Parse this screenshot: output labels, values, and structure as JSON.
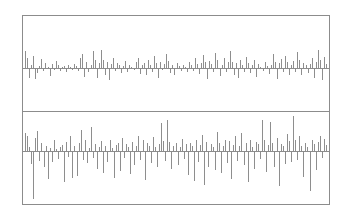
{
  "figure": {
    "title": "",
    "background_color": "#ffffff",
    "frame_color": "#8c8c8c",
    "stem_color": "#8e8e8e"
  },
  "chart_data": [
    {
      "type": "bar",
      "name": "top-panel-residuals",
      "title": "",
      "xlabel": "",
      "ylabel": "",
      "grid": false,
      "legend": null,
      "axis_labels_visible": false,
      "tick_labels_visible": false,
      "baseline": 0,
      "ylim": [
        -1,
        1
      ],
      "xlim": [
        0,
        150
      ],
      "x": [
        0,
        1,
        2,
        3,
        4,
        5,
        6,
        7,
        8,
        9,
        10,
        11,
        12,
        13,
        14,
        15,
        16,
        17,
        18,
        19,
        20,
        21,
        22,
        23,
        24,
        25,
        26,
        27,
        28,
        29,
        30,
        31,
        32,
        33,
        34,
        35,
        36,
        37,
        38,
        39,
        40,
        41,
        42,
        43,
        44,
        45,
        46,
        47,
        48,
        49,
        50,
        51,
        52,
        53,
        54,
        55,
        56,
        57,
        58,
        59,
        60,
        61,
        62,
        63,
        64,
        65,
        66,
        67,
        68,
        69,
        70,
        71,
        72,
        73,
        74,
        75,
        76,
        77,
        78,
        79,
        80,
        81,
        82,
        83,
        84,
        85,
        86,
        87,
        88,
        89,
        90,
        91,
        92,
        93,
        94,
        95,
        96,
        97,
        98,
        99,
        100,
        101,
        102,
        103,
        104,
        105,
        106,
        107,
        108,
        109,
        110,
        111,
        112,
        113,
        114,
        115,
        116,
        117,
        118,
        119,
        120,
        121,
        122,
        123,
        124,
        125,
        126,
        127,
        128,
        129,
        130,
        131,
        132,
        133,
        134,
        135,
        136,
        137,
        138,
        139,
        140,
        141,
        142,
        143,
        144,
        145,
        146,
        147,
        148,
        149
      ],
      "values": [
        0.52,
        0.3,
        -0.4,
        0.1,
        0.36,
        -0.46,
        -0.2,
        0.06,
        0.28,
        -0.08,
        0.16,
        0.04,
        -0.34,
        0.12,
        -0.06,
        0.22,
        0.08,
        -0.1,
        0.04,
        0.06,
        -0.14,
        0.1,
        0.02,
        -0.04,
        0.12,
        0.05,
        -0.08,
        0.3,
        0.44,
        -0.36,
        0.18,
        -0.12,
        0.1,
        0.54,
        0.24,
        -0.44,
        0.14,
        0.56,
        0.26,
        -0.3,
        0.2,
        -0.5,
        0.12,
        0.3,
        -0.1,
        0.16,
        0.08,
        -0.18,
        0.06,
        0.22,
        -0.14,
        0.1,
        0.04,
        -0.06,
        0.18,
        0.32,
        -0.22,
        0.08,
        0.14,
        -0.3,
        0.24,
        0.1,
        -0.12,
        0.36,
        0.16,
        -0.44,
        0.2,
        -0.06,
        0.12,
        0.42,
        0.22,
        -0.18,
        0.1,
        -0.26,
        0.14,
        0.06,
        -0.1,
        0.08,
        0.04,
        -0.14,
        0.2,
        0.1,
        -0.08,
        0.3,
        0.12,
        -0.24,
        0.16,
        0.4,
        0.18,
        -0.46,
        0.22,
        0.12,
        -0.16,
        0.48,
        0.26,
        -0.34,
        0.1,
        0.32,
        -0.14,
        0.18,
        0.52,
        0.2,
        -0.28,
        0.14,
        -0.4,
        0.24,
        0.1,
        -0.12,
        0.34,
        0.16,
        -0.2,
        0.08,
        0.26,
        -0.36,
        0.12,
        0.04,
        -0.1,
        0.18,
        0.06,
        -0.22,
        0.1,
        0.44,
        0.2,
        -0.48,
        0.14,
        0.28,
        -0.16,
        0.36,
        0.18,
        -0.26,
        0.1,
        0.22,
        -0.12,
        0.5,
        0.24,
        -0.3,
        0.16,
        0.08,
        -0.18,
        0.12,
        0.3,
        -0.42,
        0.2,
        0.56,
        0.26,
        -0.52,
        0.34,
        0.12
      ]
    },
    {
      "type": "bar",
      "name": "bottom-panel-residuals",
      "title": "",
      "xlabel": "",
      "ylabel": "",
      "grid": false,
      "legend": null,
      "axis_labels_visible": false,
      "tick_labels_visible": false,
      "baseline": 0,
      "ylim": [
        -1,
        1
      ],
      "xlim": [
        0,
        150
      ],
      "x": [
        0,
        1,
        2,
        3,
        4,
        5,
        6,
        7,
        8,
        9,
        10,
        11,
        12,
        13,
        14,
        15,
        16,
        17,
        18,
        19,
        20,
        21,
        22,
        23,
        24,
        25,
        26,
        27,
        28,
        29,
        30,
        31,
        32,
        33,
        34,
        35,
        36,
        37,
        38,
        39,
        40,
        41,
        42,
        43,
        44,
        45,
        46,
        47,
        48,
        49,
        50,
        51,
        52,
        53,
        54,
        55,
        56,
        57,
        58,
        59,
        60,
        61,
        62,
        63,
        64,
        65,
        66,
        67,
        68,
        69,
        70,
        71,
        72,
        73,
        74,
        75,
        76,
        77,
        78,
        79,
        80,
        81,
        82,
        83,
        84,
        85,
        86,
        87,
        88,
        89,
        90,
        91,
        92,
        93,
        94,
        95,
        96,
        97,
        98,
        99,
        100,
        101,
        102,
        103,
        104,
        105,
        106,
        107,
        108,
        109,
        110,
        111,
        112,
        113,
        114,
        115,
        116,
        117,
        118,
        119,
        120,
        121,
        122,
        123,
        124,
        125,
        126,
        127,
        128,
        129,
        130,
        131,
        132,
        133,
        134,
        135,
        136,
        137,
        138,
        139,
        140,
        141,
        142,
        143,
        144,
        145,
        146,
        147,
        148,
        149
      ],
      "values": [
        0.46,
        0.4,
        0.1,
        -0.24,
        -0.96,
        0.34,
        0.52,
        -0.18,
        0.22,
        -0.3,
        0.12,
        -0.56,
        0.08,
        -0.2,
        0.3,
        0.06,
        -0.14,
        0.1,
        0.16,
        -0.62,
        0.24,
        -0.1,
        0.38,
        -0.54,
        0.14,
        -0.5,
        0.2,
        0.56,
        -0.16,
        0.28,
        -0.22,
        0.08,
        0.62,
        -0.12,
        0.18,
        -0.34,
        0.1,
        0.26,
        -0.44,
        0.14,
        -0.2,
        0.3,
        0.08,
        -0.54,
        0.16,
        0.22,
        -0.38,
        0.34,
        -0.12,
        0.18,
        0.1,
        -0.46,
        0.24,
        -0.26,
        0.12,
        0.4,
        -0.16,
        0.3,
        -0.58,
        0.2,
        0.14,
        -0.22,
        0.36,
        0.1,
        -0.3,
        0.18,
        0.72,
        0.26,
        -0.18,
        0.8,
        0.24,
        -0.34,
        0.14,
        0.2,
        -0.26,
        0.1,
        0.32,
        -0.14,
        0.18,
        -0.48,
        0.22,
        0.12,
        -0.6,
        0.28,
        -0.2,
        0.16,
        0.42,
        -0.68,
        0.24,
        -0.3,
        0.18,
        0.1,
        -0.36,
        0.5,
        0.2,
        -0.44,
        0.14,
        0.3,
        -0.22,
        0.26,
        -0.56,
        0.16,
        0.38,
        -0.18,
        0.12,
        0.46,
        -0.26,
        0.2,
        -0.62,
        0.3,
        0.1,
        -0.34,
        0.24,
        0.18,
        -0.14,
        0.8,
        0.28,
        -0.4,
        0.16,
        0.76,
        0.22,
        -0.3,
        0.34,
        -0.7,
        0.18,
        0.12,
        -0.24,
        0.44,
        0.26,
        -0.2,
        0.92,
        0.3,
        -0.16,
        0.38,
        0.14,
        -0.52,
        0.22,
        0.1,
        -0.8,
        0.28,
        0.18,
        -0.36,
        0.24,
        0.4,
        -0.12,
        0.32,
        0.16
      ]
    }
  ]
}
